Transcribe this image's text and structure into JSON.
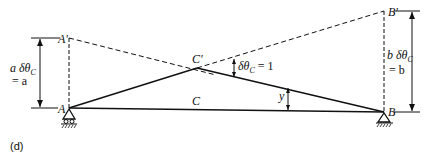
{
  "figure": {
    "panel_label": "(d)",
    "points": {
      "A": "A",
      "A_prime": "A'",
      "B": "B",
      "B_prime": "B'",
      "C": "C",
      "C_prime": "C'"
    },
    "dimensions": {
      "left_line1": "a δθ",
      "left_sub": "C",
      "left_line2": "= a",
      "right_line1": "b δθ",
      "right_sub": "C",
      "right_line2": "= b",
      "rotation": "δθ",
      "rotation_sub": "C",
      "rotation_value": " = 1",
      "deflection": "y"
    }
  }
}
